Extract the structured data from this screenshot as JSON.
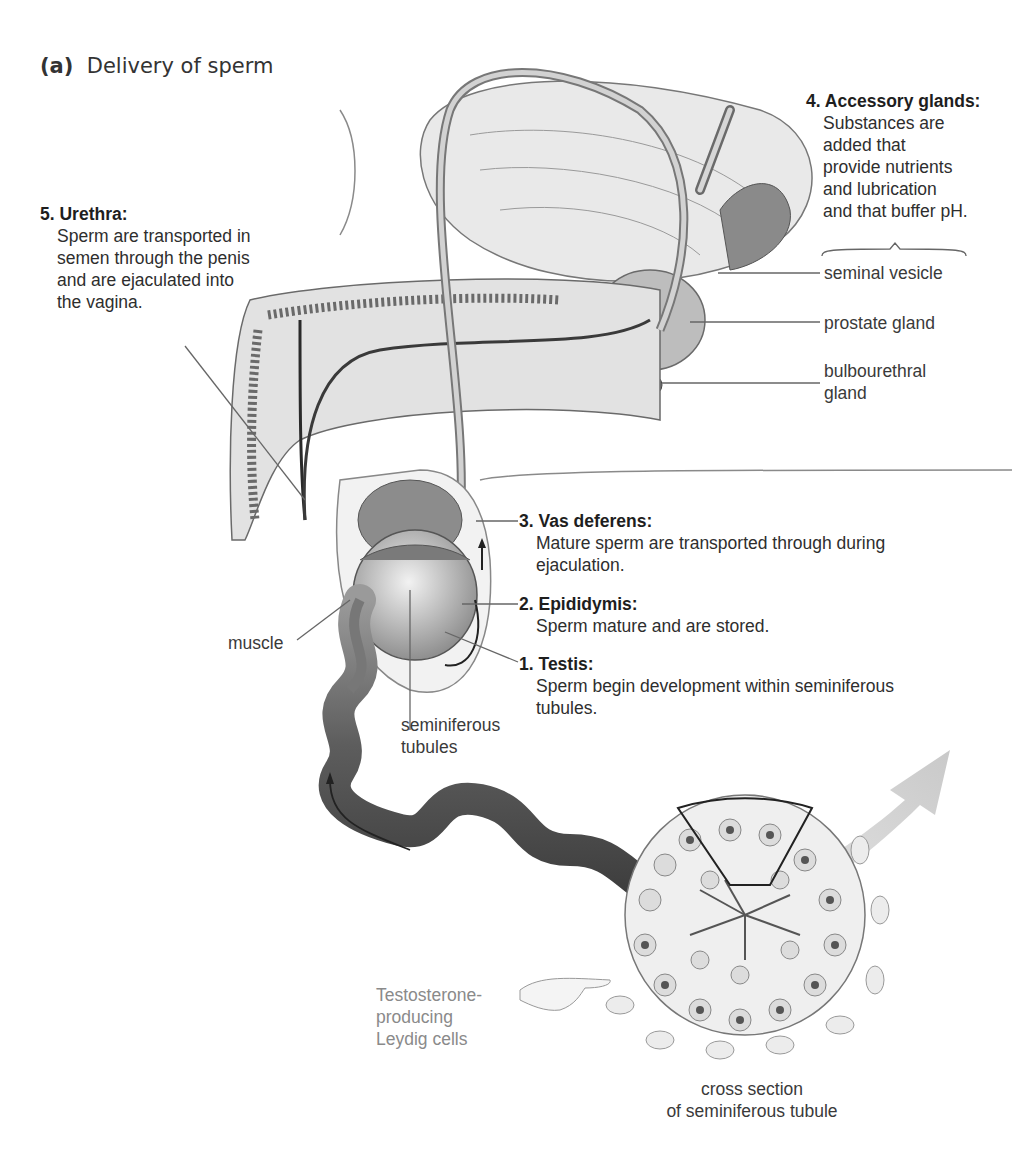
{
  "figure": {
    "panel_letter": "(a)",
    "title": "Delivery of sperm"
  },
  "steps": [
    {
      "number": "1.",
      "heading": "Testis:",
      "text": "Sperm begin development within seminiferous tubules.",
      "line1": "Sperm begin development within seminiferous",
      "line2": "tubules."
    },
    {
      "number": "2.",
      "heading": "Epididymis:",
      "text": "Sperm mature and are stored.",
      "line1": "Sperm mature and are stored."
    },
    {
      "number": "3.",
      "heading": "Vas deferens:",
      "text": "Mature sperm are transported through during ejaculation.",
      "line1": "Mature sperm are transported through during",
      "line2": "ejaculation."
    },
    {
      "number": "4.",
      "heading": "Accessory glands:",
      "line1": "Substances are",
      "line2": "added that",
      "line3": "provide nutrients",
      "line4": "and  lubrication",
      "line5": "and that buffer pH."
    },
    {
      "number": "5.",
      "heading": "Urethra:",
      "line1": "Sperm are transported in",
      "line2": "semen through the penis",
      "line3": "and are ejaculated into",
      "line4": "the vagina."
    }
  ],
  "gland_labels": {
    "seminal_vesicle": "seminal vesicle",
    "prostate_gland": "prostate gland",
    "bulbourethral_line1": "bulbourethral",
    "bulbourethral_line2": "gland"
  },
  "other_labels": {
    "muscle": "muscle",
    "seminiferous_line1": "seminiferous",
    "seminiferous_line2": "tubules",
    "leydig_line1": "Testosterone-",
    "leydig_line2": "producing",
    "leydig_line3": "Leydig cells",
    "cross_section_line1": "cross section",
    "cross_section_line2": "of seminiferous tubule"
  },
  "colors": {
    "text": "#2e2e2e",
    "tissue_light": "#e6e6e6",
    "tissue_mid": "#b5b5b5",
    "tissue_dark": "#6a6a6a",
    "arrow_grey": "#cfcfcf",
    "leydig_text": "#8a8a8a"
  }
}
